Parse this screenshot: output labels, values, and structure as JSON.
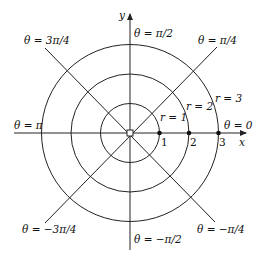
{
  "diagram": {
    "center": {
      "x": 130,
      "y": 133
    },
    "unit_px": 29.5,
    "axes": {
      "x_label": "x",
      "y_label": "y"
    },
    "circles": [
      {
        "r": 1,
        "label": "r = 1"
      },
      {
        "r": 2,
        "label": "r = 2"
      },
      {
        "r": 3,
        "label": "r = 3"
      }
    ],
    "tick_labels": [
      "1",
      "2",
      "3"
    ],
    "rays": [
      {
        "angle": "0",
        "label": "θ = 0"
      },
      {
        "angle": "π/4",
        "label": "θ = π/4"
      },
      {
        "angle": "π/2",
        "label": "θ = π/2"
      },
      {
        "angle": "3π/4",
        "label": "θ = 3π/4"
      },
      {
        "angle": "π",
        "label": "θ = π"
      },
      {
        "angle": "−3π/4",
        "label": "θ = −3π/4"
      },
      {
        "angle": "−π/2",
        "label": "θ = −π/2"
      },
      {
        "angle": "−π/4",
        "label": "θ = −π/4"
      }
    ],
    "stroke_color": "#222222"
  }
}
